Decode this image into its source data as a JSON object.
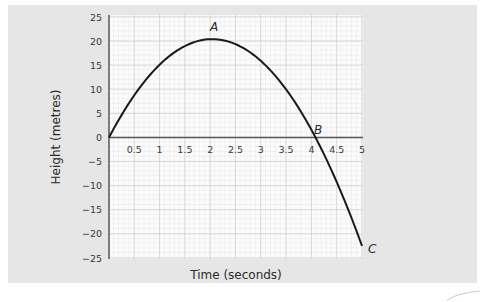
{
  "chart_data": {
    "type": "line",
    "title": "",
    "xlabel": "Time (seconds)",
    "ylabel": "Height (metres)",
    "xlim": [
      0,
      5
    ],
    "ylim": [
      -25,
      25
    ],
    "x_ticks": [
      "0.5",
      "1",
      "1.5",
      "2",
      "2.5",
      "3",
      "3.5",
      "4",
      "4.5",
      "5"
    ],
    "y_ticks": [
      "25",
      "20",
      "15",
      "10",
      "5",
      "0",
      "−5",
      "−10",
      "−15",
      "−20",
      "−25"
    ],
    "grid": true,
    "legend": null,
    "series": [
      {
        "name": "height",
        "x": [
          0,
          0.5,
          1,
          1.5,
          2,
          2.04,
          2.5,
          3,
          3.5,
          4,
          4.08,
          4.5,
          5
        ],
        "y": [
          0,
          8.8,
          15.1,
          19.0,
          20.4,
          20.4,
          19.4,
          15.9,
          10.0,
          1.6,
          0,
          -9.2,
          -22.5
        ]
      }
    ],
    "annotations": [
      {
        "label": "A",
        "x": 2.04,
        "y": 20.4,
        "note": "maximum height"
      },
      {
        "label": "B",
        "x": 4.08,
        "y": 0,
        "note": "crosses ground level"
      },
      {
        "label": "C",
        "x": 5,
        "y": -22.5,
        "note": "end point"
      }
    ]
  },
  "labels": {
    "xlabel": "Time (seconds)",
    "ylabel": "Height (metres)",
    "A": "A",
    "B": "B",
    "C": "C",
    "x_ticks": [
      "0.5",
      "1",
      "1.5",
      "2",
      "2.5",
      "3",
      "3.5",
      "4",
      "4.5",
      "5"
    ],
    "y_ticks": [
      "25",
      "20",
      "15",
      "10",
      "5",
      "0",
      "−5",
      "−10",
      "−15",
      "−20",
      "−25"
    ]
  }
}
